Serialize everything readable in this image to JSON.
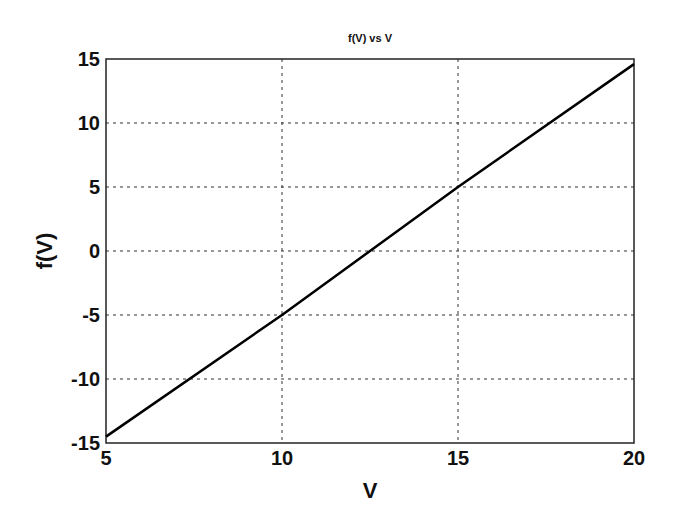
{
  "chart_data": {
    "type": "line",
    "title": "f(V) vs V",
    "xlabel": "V",
    "ylabel": "f(V)",
    "xlim": [
      5,
      20
    ],
    "ylim": [
      -15,
      15
    ],
    "xticks": [
      5,
      10,
      15,
      20
    ],
    "yticks": [
      -15,
      -10,
      -5,
      0,
      5,
      10,
      15
    ],
    "grid": true,
    "legend": null,
    "series": [
      {
        "name": "f(V)",
        "approximate_formula": "f(V) ≈ 2V − 25",
        "x": [
          5,
          10,
          15,
          20
        ],
        "y": [
          -14.5,
          -5,
          5,
          14.6
        ]
      }
    ]
  }
}
